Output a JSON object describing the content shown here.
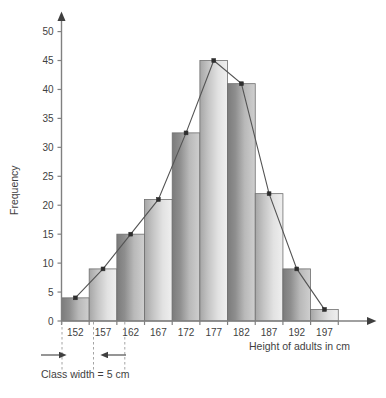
{
  "chart_data": {
    "type": "bar",
    "title": "",
    "subtitle": "",
    "xlabel": "Height of adults in cm",
    "ylabel": "Frequency",
    "categories": [
      "152",
      "157",
      "162",
      "167",
      "172",
      "177",
      "182",
      "187",
      "192",
      "197"
    ],
    "values": [
      4,
      9,
      15,
      21,
      32.5,
      45,
      41,
      22,
      9,
      2
    ],
    "series": [
      {
        "name": "Frequency",
        "values": [
          4,
          9,
          15,
          21,
          32.5,
          45,
          41,
          22,
          9,
          2
        ]
      },
      {
        "name": "Frequency polygon",
        "values": [
          4,
          9,
          15,
          21,
          32.5,
          45,
          41,
          22,
          9,
          2
        ]
      }
    ],
    "ylim": [
      0,
      52
    ],
    "xlim": [
      149.5,
      199.5
    ],
    "ytick_labels": [
      "0",
      "5",
      "10",
      "15",
      "20",
      "25",
      "30",
      "35",
      "40",
      "45",
      "50"
    ],
    "ytick_values": [
      0,
      5,
      10,
      15,
      20,
      25,
      30,
      35,
      40,
      45,
      50
    ],
    "xtick_labels": [
      "152",
      "157",
      "162",
      "167",
      "172",
      "177",
      "182",
      "187",
      "192",
      "197"
    ],
    "grid": false,
    "legend": "none",
    "class_width": 5,
    "class_width_units": "cm",
    "annotation": "Class width  =  5 cm",
    "overlay": "frequency polygon with point markers at class midpoints",
    "bar_style": "each bar filled with a dark-to-light horizontal gradient, alternating tone between adjacent bars",
    "colors": {
      "bar_dark": "#808080",
      "bar_mid": "#a9a9a9",
      "bar_light": "#d9d9d9",
      "bar_lightest": "#ececec",
      "bar_outline": "#6f6f6f",
      "axis": "#808080",
      "polygon_line": "#545454",
      "marker": "#2e2e2e",
      "text": "#3f3f3f",
      "background": "#ffffff",
      "guide_dash": "#9a9a9a"
    }
  },
  "axes": {
    "y_title": "Frequency",
    "x_title": "Height of adults in cm"
  },
  "annotation": {
    "class_width_label": "Class width  =  5 cm"
  }
}
